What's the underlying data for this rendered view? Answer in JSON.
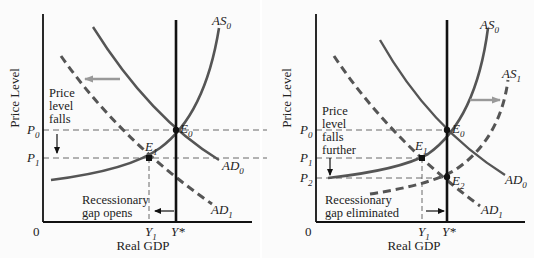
{
  "figure": {
    "background": "#fbfbfb",
    "curve_color": "#555555",
    "axis_color": "#111111",
    "shift_arrow_color": "#999999"
  },
  "left_panel": {
    "y_axis_label": "Price Level",
    "x_axis_label": "Real GDP",
    "origin": "0",
    "curves": {
      "as0": {
        "main": "AS",
        "sub": "0"
      },
      "ad0": {
        "main": "AD",
        "sub": "0"
      },
      "ad1": {
        "main": "AD",
        "sub": "1"
      }
    },
    "points": {
      "e0": {
        "main": "E",
        "sub": "0"
      },
      "e1": {
        "main": "E",
        "sub": "1"
      }
    },
    "price_ticks": {
      "p0": {
        "main": "P",
        "sub": "0"
      },
      "p1": {
        "main": "P",
        "sub": "1"
      }
    },
    "output_ticks": {
      "y1": {
        "main": "Y",
        "sub": "1"
      },
      "ystar": "Y*"
    },
    "annotation_price": [
      "Price",
      "level",
      "falls"
    ],
    "annotation_gap": [
      "Recessionary",
      "gap opens"
    ]
  },
  "right_panel": {
    "y_axis_label": "Price Level",
    "x_axis_label": "Real GDP",
    "origin": "0",
    "curves": {
      "as0": {
        "main": "AS",
        "sub": "0"
      },
      "as1": {
        "main": "AS",
        "sub": "1"
      },
      "ad0": {
        "main": "AD",
        "sub": "0"
      },
      "ad1": {
        "main": "AD",
        "sub": "1"
      }
    },
    "points": {
      "e0": {
        "main": "E",
        "sub": "0"
      },
      "e1": {
        "main": "E",
        "sub": "1"
      },
      "e2": {
        "main": "E",
        "sub": "2"
      }
    },
    "price_ticks": {
      "p0": {
        "main": "P",
        "sub": "0"
      },
      "p1": {
        "main": "P",
        "sub": "1"
      },
      "p2": {
        "main": "P",
        "sub": "2"
      }
    },
    "output_ticks": {
      "y1": {
        "main": "Y",
        "sub": "1"
      },
      "ystar": "Y*"
    },
    "annotation_price": [
      "Price",
      "level",
      "falls",
      "further"
    ],
    "annotation_gap": [
      "Recessionary",
      "gap eliminated"
    ]
  }
}
